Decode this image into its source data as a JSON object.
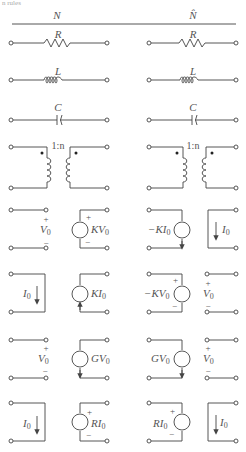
{
  "caption_fragment": "n rules",
  "headers": {
    "left": "N",
    "right": "N̂"
  },
  "rows": [
    {
      "type": "resistor",
      "left_label": "R",
      "right_label": "R"
    },
    {
      "type": "inductor",
      "left_label": "L",
      "right_label": "L"
    },
    {
      "type": "capacitor",
      "left_label": "C",
      "right_label": "C"
    },
    {
      "type": "transformer",
      "left_label": "1:n",
      "right_label": "1:n"
    },
    {
      "type": "vcvs",
      "left": {
        "port1_label": "V",
        "port1_sub": "0",
        "port1_plus": "+",
        "port1_minus": "−",
        "source_label": "KV",
        "source_sub": "0",
        "source_plus": "+",
        "source_minus": "−"
      },
      "right": {
        "source_label": "−KI",
        "source_sub": "0",
        "port_label": "I",
        "port_sub": "0"
      }
    },
    {
      "type": "cccs",
      "left": {
        "port1_label": "I",
        "port1_sub": "0",
        "source_label": "KI",
        "source_sub": "0"
      },
      "right": {
        "source_label": "−KV",
        "source_sub": "0",
        "source_plus": "+",
        "source_minus": "−",
        "port_label": "V",
        "port_sub": "0",
        "port_plus": "+",
        "port_minus": "−"
      }
    },
    {
      "type": "vccs",
      "left": {
        "port1_label": "V",
        "port1_sub": "0",
        "port1_plus": "+",
        "port1_minus": "−",
        "source_label": "GV",
        "source_sub": "0"
      },
      "right": {
        "source_label": "GV",
        "source_sub": "0",
        "port_label": "V",
        "port_sub": "0",
        "port_plus": "+",
        "port_minus": "−"
      }
    },
    {
      "type": "ccvs",
      "left": {
        "port1_label": "I",
        "port1_sub": "0",
        "source_label": "RI",
        "source_sub": "0",
        "source_plus": "+",
        "source_minus": "−"
      },
      "right": {
        "source_label": "RI",
        "source_sub": "0",
        "source_plus": "+",
        "source_minus": "−",
        "port_label": "I",
        "port_sub": "0"
      }
    }
  ]
}
